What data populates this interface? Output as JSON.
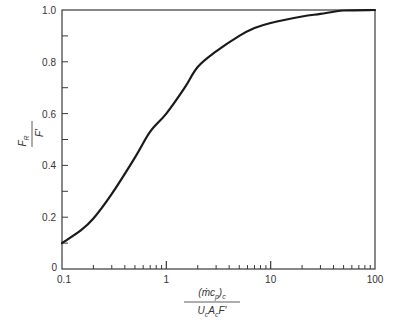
{
  "chart_data": {
    "type": "line",
    "title": "",
    "xlabel": "(ṁc_p)_c / (U_c A_c F')",
    "ylabel": "F_R / F'",
    "xscale": "log",
    "xlim": [
      0.1,
      100
    ],
    "ylim": [
      0,
      1.0
    ],
    "grid": false,
    "legend": null,
    "x_ticks": [
      "0.1",
      "1",
      "10",
      "100"
    ],
    "y_ticks": [
      "0",
      "0.2",
      "0.4",
      "0.6",
      "0.8",
      "1.0"
    ],
    "series": [
      {
        "name": "F_R/F'",
        "x": [
          0.1,
          0.15,
          0.2,
          0.3,
          0.5,
          0.7,
          1,
          1.5,
          2,
          3,
          5,
          7,
          10,
          20,
          30,
          50,
          100
        ],
        "y": [
          0.1,
          0.148,
          0.195,
          0.29,
          0.43,
          0.53,
          0.6,
          0.7,
          0.78,
          0.84,
          0.9,
          0.93,
          0.95,
          0.975,
          0.985,
          0.998,
          1.0
        ]
      }
    ]
  },
  "axes": {
    "y_labels": [
      "0",
      "0.2",
      "0.4",
      "0.6",
      "0.8",
      "1.0"
    ],
    "x_labels": [
      "0.1",
      "1",
      "10",
      "100"
    ],
    "ylabel": {
      "num": "F",
      "num_sub": "R",
      "den": "F'"
    },
    "xlabel": {
      "num": "(ṁc",
      "num_sub1": "p",
      "num_close": ")",
      "num_sub2": "c",
      "den_U": "U",
      "den_Us": "c",
      "den_A": "A",
      "den_As": "c",
      "den_F": "F'"
    }
  }
}
